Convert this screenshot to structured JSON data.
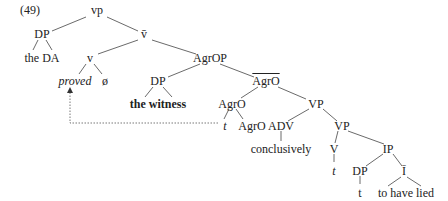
{
  "example_number": "(49)",
  "nodes": {
    "vp": "vp",
    "dp_subj": "DP",
    "vbar": "v̄",
    "the_da": "the DA",
    "v": "v",
    "agrop": "AgrOP",
    "proved": "proved",
    "null": "ø",
    "dp_obj": "DP",
    "agrobar": "AgrO",
    "the_witness": "the witness",
    "agro": "AgrO",
    "vp1": "VP",
    "t_trace": "t",
    "agro_head": "AgrO",
    "adv": "ADV",
    "vp2": "VP",
    "conclusively": "conclusively",
    "v_lower": "V",
    "ip": "IP",
    "t_v": "t",
    "dp_lower": "DP",
    "ibar": "Ī",
    "t_dp": "t",
    "to_have_lied": "to have lied"
  }
}
